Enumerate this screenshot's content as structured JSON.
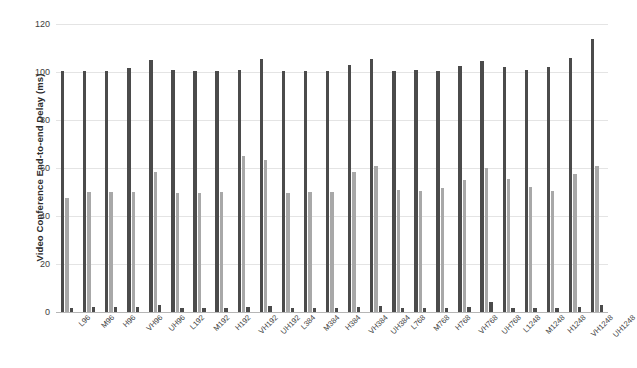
{
  "chart_data": {
    "type": "bar",
    "title": "",
    "subtitle": "",
    "xlabel": "",
    "ylabel": "Video Conference End-to-end Delay (ms)",
    "ylim": [
      0,
      120
    ],
    "ytick_values": [
      0,
      20,
      40,
      60,
      80,
      100,
      120
    ],
    "ytick_labels": [
      "0",
      "20",
      "40",
      "60",
      "80",
      "100",
      "120"
    ],
    "grid": true,
    "legend": "none",
    "categories": [
      "L96",
      "M96",
      "H96",
      "VH96",
      "UH96",
      "L192",
      "M192",
      "H192",
      "VH192",
      "UH192",
      "L384",
      "M384",
      "H384",
      "VH384",
      "UH384",
      "L768",
      "M768",
      "H768",
      "VH768",
      "UH768",
      "L1248",
      "M1248",
      "H1248",
      "VH1248",
      "UH1248"
    ],
    "series": [
      {
        "name": "series-1",
        "color": "#4b4b4b",
        "values": [
          100.5,
          100.5,
          100.5,
          101.5,
          104.8,
          101.0,
          100.5,
          100.5,
          101.0,
          105.5,
          100.5,
          100.5,
          100.5,
          103.0,
          105.5,
          100.5,
          101.0,
          100.5,
          102.5,
          104.5,
          102.0,
          101.0,
          102.0,
          106.0,
          113.8
        ]
      },
      {
        "name": "series-2",
        "color": "#a8a8a8",
        "values": [
          47.5,
          50.0,
          50.0,
          50.0,
          58.5,
          49.5,
          49.5,
          50.0,
          64.8,
          63.5,
          49.5,
          50.0,
          50.0,
          58.5,
          61.0,
          51.0,
          50.5,
          51.5,
          55.0,
          60.0,
          55.5,
          52.0,
          50.5,
          57.5,
          61.0
        ]
      },
      {
        "name": "series-3",
        "color": "#4b4b4b",
        "values": [
          1.5,
          2.0,
          2.0,
          2.0,
          3.0,
          1.5,
          1.5,
          1.5,
          2.0,
          2.5,
          1.5,
          1.5,
          1.5,
          2.0,
          2.5,
          1.5,
          1.5,
          1.5,
          2.0,
          4.0,
          1.5,
          1.5,
          1.5,
          2.0,
          3.0
        ]
      }
    ]
  }
}
